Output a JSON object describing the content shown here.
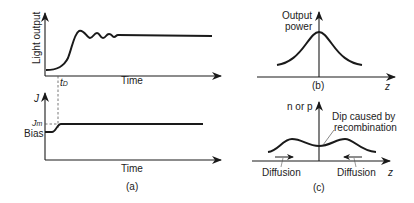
{
  "figure": {
    "panel_a": {
      "caption": "(a)",
      "top_plot": {
        "ylabel": "Light output",
        "xlabel": "Time",
        "marker": "t",
        "marker_sub": "D",
        "curve_description": "Light output rises after delay t_D, overshoots, shows damped relaxation oscillations, then settles to steady level"
      },
      "bottom_plot": {
        "ylabel": "J",
        "xlabel": "Time",
        "level_high": "J",
        "level_high_sub": "m",
        "level_low": "Bias",
        "curve_description": "Current density steps from bias level up to J_m"
      }
    },
    "panel_b": {
      "caption": "(b)",
      "ylabel_line1": "Output",
      "ylabel_line2": "power",
      "xlabel": "z",
      "curve_description": "Bell-shaped output power profile centered at z=0"
    },
    "panel_c": {
      "caption": "(c)",
      "ylabel": "n or p",
      "xlabel": "z",
      "annotation_line1": "Dip caused by",
      "annotation_line2": "recombination",
      "left_arrow_label": "Diffusion",
      "right_arrow_label": "Diffusion",
      "curve_description": "Carrier density profile with two peaks and a central dip caused by recombination"
    }
  },
  "colors": {
    "line": "#1a1a1a",
    "background": "#ffffff"
  }
}
